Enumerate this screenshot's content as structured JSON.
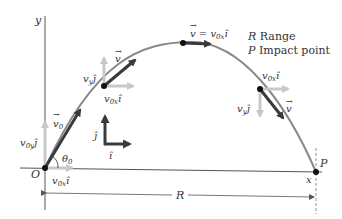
{
  "diagram": {
    "colors": {
      "axes": "#555555",
      "trajectory": "#888888",
      "velocity_vector": "#3a3a3a",
      "component_vector": "#c8c8c8",
      "point": "#111111",
      "background": "#ffffff"
    },
    "axes": {
      "y_label": "y",
      "x_label": "x",
      "origin_label": "O"
    },
    "legend": {
      "items": [
        {
          "symbol": "R",
          "text": " Range"
        },
        {
          "symbol": "P",
          "text": " Impact point"
        }
      ]
    },
    "launch": {
      "velocity_label": "v",
      "velocity_sub": "0",
      "vy_label": "v",
      "vy_sub": "0y",
      "vy_unit": "ĵ",
      "vx_label": "v",
      "vx_sub": "0x",
      "vx_unit": "î",
      "angle_label": "θ",
      "angle_sub": "0"
    },
    "rising_point": {
      "velocity_label": "v",
      "vy_label": "v",
      "vy_sub": "y",
      "vy_unit": "ĵ",
      "vx_label": "v",
      "vx_sub": "0x",
      "vx_unit": "î"
    },
    "apex": {
      "equation_lhs": "v",
      "equation_eq": " = ",
      "equation_rhs": "v",
      "equation_sub": "0x",
      "equation_unit": "î"
    },
    "falling_point": {
      "velocity_label": "v",
      "vy_label": "v",
      "vy_sub": "y",
      "vy_unit": "ĵ",
      "vx_label": "v",
      "vx_sub": "0x",
      "vx_unit": "î"
    },
    "unit_vectors": {
      "j_label": "ĵ",
      "i_label": "î"
    },
    "impact": {
      "label": "P"
    },
    "range": {
      "label": "R"
    }
  }
}
